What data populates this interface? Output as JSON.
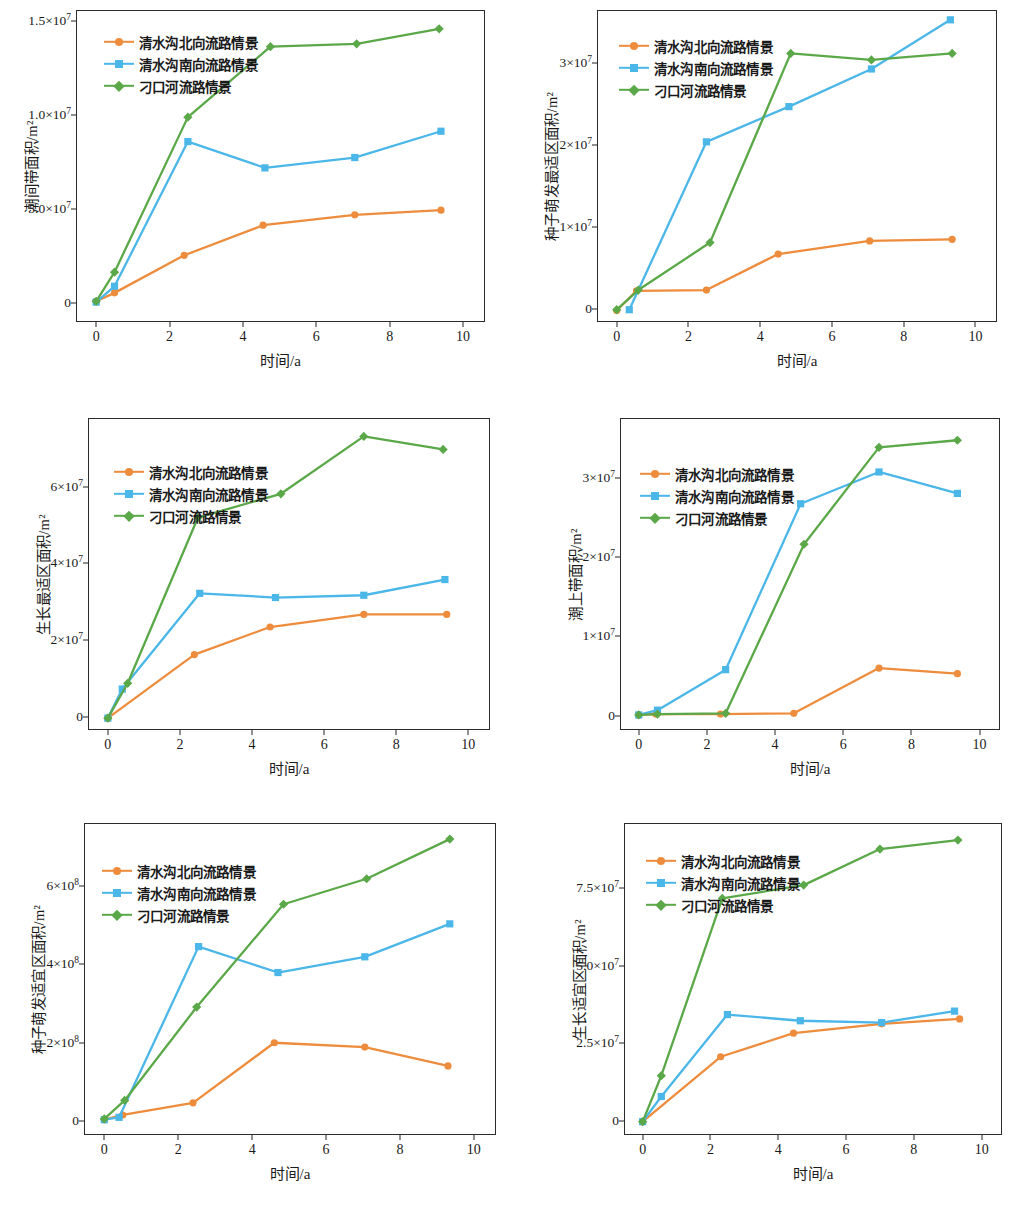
{
  "figure": {
    "panel_count": 6,
    "x_axis_label": "时间/a",
    "x_ticks": [
      "0",
      "2",
      "4",
      "6",
      "8",
      "10"
    ],
    "series_names": [
      "清水沟北向流路情景",
      "清水沟南向流路情景",
      "刁口河流路情景"
    ],
    "colors": {
      "series1": "#ED8C3C",
      "series2": "#4BB6E8",
      "series3": "#5BA849",
      "axis": "#2b2b2b",
      "text": "#1a1a1a"
    },
    "markers": [
      "circle",
      "square",
      "diamond"
    ]
  },
  "chart_data": [
    {
      "type": "line",
      "panel": "top-left",
      "title": "",
      "xlabel": "时间/a",
      "ylabel": "潮间带面积/m²",
      "xlim": [
        -0.55,
        10.6
      ],
      "ylim": [
        -1000000,
        15600000
      ],
      "xticks": [
        0,
        2,
        4,
        6,
        8,
        10
      ],
      "xticklabels": [
        "0",
        "2",
        "4",
        "6",
        "8",
        "10"
      ],
      "yticks": [
        0,
        5000000,
        10000000,
        15000000
      ],
      "yticklabels": [
        "0",
        "5.0×10⁷",
        "1.0×10⁷",
        "1.5×10⁷"
      ],
      "grid": false,
      "legend_position": "upper-left",
      "series": [
        {
          "name": "清水沟北向流路情景",
          "marker": "circle",
          "color": "#ED8C3C",
          "x": [
            0.0,
            0.5,
            2.4,
            4.55,
            7.05,
            9.4
          ],
          "y": [
            100000,
            550000,
            2550000,
            4150000,
            4700000,
            4950000
          ]
        },
        {
          "name": "清水沟南向流路情景",
          "marker": "square",
          "color": "#4BB6E8",
          "x": [
            0.0,
            0.5,
            2.5,
            4.6,
            7.05,
            9.4
          ],
          "y": [
            60000,
            900000,
            8600000,
            7200000,
            7750000,
            9150000
          ]
        },
        {
          "name": "刁口河流路情景",
          "marker": "diamond",
          "color": "#5BA849",
          "x": [
            0.0,
            0.5,
            2.5,
            4.75,
            7.1,
            9.35
          ],
          "y": [
            100000,
            1650000,
            9900000,
            13650000,
            13800000,
            14600000
          ]
        }
      ]
    },
    {
      "type": "line",
      "panel": "top-right",
      "title": "",
      "xlabel": "时间/a",
      "ylabel": "种子萌发最适区面积/m²",
      "xlim": [
        -0.55,
        10.6
      ],
      "ylim": [
        -1600000,
        36500000
      ],
      "xticks": [
        0,
        2,
        4,
        6,
        8,
        10
      ],
      "xticklabels": [
        "0",
        "2",
        "4",
        "6",
        "8",
        "10"
      ],
      "yticks": [
        0,
        10000000,
        20000000,
        30000000
      ],
      "yticklabels": [
        "0",
        "1×10⁷",
        "2×10⁷",
        "3×10⁷"
      ],
      "grid": false,
      "legend_position": "upper-left",
      "series": [
        {
          "name": "清水沟北向流路情景",
          "marker": "circle",
          "color": "#ED8C3C",
          "x": [
            0.0,
            0.55,
            2.5,
            4.5,
            7.05,
            9.35
          ],
          "y": [
            -200000,
            2200000,
            2300000,
            6700000,
            8300000,
            8500000
          ]
        },
        {
          "name": "清水沟南向流路情景",
          "marker": "square",
          "color": "#4BB6E8",
          "x": [
            0.35,
            2.5,
            4.8,
            7.1,
            9.3
          ],
          "y": [
            -100000,
            20400000,
            24700000,
            29300000,
            35300000
          ]
        },
        {
          "name": "刁口河流路情景",
          "marker": "diamond",
          "color": "#5BA849",
          "x": [
            0.0,
            0.6,
            2.6,
            4.85,
            7.1,
            9.35
          ],
          "y": [
            -100000,
            2300000,
            8100000,
            31200000,
            30400000,
            31200000
          ]
        }
      ]
    },
    {
      "type": "line",
      "panel": "middle-left",
      "title": "",
      "xlabel": "时间/a",
      "ylabel": "生长最适区面积/m²",
      "xlim": [
        -0.55,
        10.6
      ],
      "ylim": [
        -3500000,
        78000000
      ],
      "xticks": [
        0,
        2,
        4,
        6,
        8,
        10
      ],
      "xticklabels": [
        "0",
        "2",
        "4",
        "6",
        "8",
        "10"
      ],
      "yticks": [
        0,
        20000000,
        40000000,
        60000000
      ],
      "yticklabels": [
        "0",
        "2×10⁷",
        "4×10⁷",
        "6×10⁷"
      ],
      "grid": false,
      "legend_position": "upper-left",
      "series": [
        {
          "name": "清水沟北向流路情景",
          "marker": "circle",
          "color": "#ED8C3C",
          "x": [
            0.0,
            2.4,
            4.5,
            7.1,
            9.4
          ],
          "y": [
            -400000,
            16200000,
            23400000,
            26700000,
            26700000
          ]
        },
        {
          "name": "清水沟南向流路情景",
          "marker": "square",
          "color": "#4BB6E8",
          "x": [
            0.0,
            0.4,
            2.55,
            4.65,
            7.1,
            9.35
          ],
          "y": [
            -400000,
            7200000,
            32200000,
            31100000,
            31700000,
            35800000
          ]
        },
        {
          "name": "刁口河流路情景",
          "marker": "diamond",
          "color": "#5BA849",
          "x": [
            0.0,
            0.55,
            2.5,
            4.8,
            7.1,
            9.3
          ],
          "y": [
            -400000,
            8700000,
            52000000,
            58200000,
            73200000,
            69800000
          ]
        }
      ]
    },
    {
      "type": "line",
      "panel": "middle-right",
      "title": "",
      "xlabel": "时间/a",
      "ylabel": "潮上带面积/m²",
      "xlim": [
        -0.55,
        10.6
      ],
      "ylim": [
        -1800000,
        37500000
      ],
      "xticks": [
        0,
        2,
        4,
        6,
        8,
        10
      ],
      "xticklabels": [
        "0",
        "2",
        "4",
        "6",
        "8",
        "10"
      ],
      "yticks": [
        0,
        10000000,
        20000000,
        30000000
      ],
      "yticklabels": [
        "0",
        "1×10⁷",
        "2×10⁷",
        "3×10⁷"
      ],
      "grid": false,
      "legend_position": "upper-left",
      "series": [
        {
          "name": "清水沟北向流路情景",
          "marker": "circle",
          "color": "#ED8C3C",
          "x": [
            0.0,
            0.5,
            2.4,
            4.55,
            7.05,
            9.35
          ],
          "y": [
            100000,
            200000,
            200000,
            300000,
            6000000,
            5300000
          ]
        },
        {
          "name": "清水沟南向流路情景",
          "marker": "square",
          "color": "#4BB6E8",
          "x": [
            0.0,
            0.55,
            2.55,
            4.75,
            7.05,
            9.35
          ],
          "y": [
            100000,
            700000,
            5800000,
            26700000,
            30700000,
            28000000
          ]
        },
        {
          "name": "刁口河流路情景",
          "marker": "diamond",
          "color": "#5BA849",
          "x": [
            0.0,
            0.55,
            2.55,
            4.85,
            7.05,
            9.35
          ],
          "y": [
            100000,
            200000,
            300000,
            21600000,
            33800000,
            34700000
          ]
        }
      ]
    },
    {
      "type": "line",
      "panel": "bottom-left",
      "title": "",
      "xlabel": "时间/a",
      "ylabel": "种子萌发适宜区面积/m²",
      "xlim": [
        -0.55,
        10.6
      ],
      "ylim": [
        -35000000,
        760000000
      ],
      "xticks": [
        0,
        2,
        4,
        6,
        8,
        10
      ],
      "xticklabels": [
        "0",
        "2",
        "4",
        "6",
        "8",
        "10"
      ],
      "yticks": [
        0,
        200000000,
        400000000,
        600000000
      ],
      "yticklabels": [
        "0",
        "2×10⁸",
        "4×10⁸",
        "6×10⁸"
      ],
      "grid": false,
      "legend_position": "upper-left",
      "series": [
        {
          "name": "清水沟北向流路情景",
          "marker": "circle",
          "color": "#ED8C3C",
          "x": [
            0.0,
            0.5,
            2.4,
            4.6,
            7.05,
            9.3
          ],
          "y": [
            4000000,
            16000000,
            47000000,
            200000000,
            189000000,
            141000000
          ]
        },
        {
          "name": "清水沟南向流路情景",
          "marker": "square",
          "color": "#4BB6E8",
          "x": [
            0.0,
            0.4,
            2.55,
            4.7,
            7.05,
            9.35
          ],
          "y": [
            4000000,
            10000000,
            445000000,
            379000000,
            419000000,
            503000000
          ]
        },
        {
          "name": "刁口河流路情景",
          "marker": "diamond",
          "color": "#5BA849",
          "x": [
            0.0,
            0.55,
            2.5,
            4.85,
            7.1,
            9.35
          ],
          "y": [
            6000000,
            53000000,
            291000000,
            553000000,
            618000000,
            719000000
          ]
        }
      ]
    },
    {
      "type": "line",
      "panel": "bottom-right",
      "title": "",
      "xlabel": "时间/a",
      "ylabel": "生长适宜区面积/m²",
      "xlim": [
        -0.55,
        10.6
      ],
      "ylim": [
        -4500000,
        96000000
      ],
      "xticks": [
        0,
        2,
        4,
        6,
        8,
        10
      ],
      "xticklabels": [
        "0",
        "2",
        "4",
        "6",
        "8",
        "10"
      ],
      "yticks": [
        0,
        25000000,
        50000000,
        75000000
      ],
      "yticklabels": [
        "0",
        "2.5×10⁷",
        "5.0×10⁷",
        "7.5×10⁷"
      ],
      "grid": false,
      "legend_position": "upper-left",
      "series": [
        {
          "name": "清水沟北向流路情景",
          "marker": "circle",
          "color": "#ED8C3C",
          "x": [
            0.0,
            2.3,
            4.45,
            7.05,
            9.35
          ],
          "y": [
            -200000,
            20700000,
            28300000,
            31300000,
            32900000
          ]
        },
        {
          "name": "清水沟南向流路情景",
          "marker": "square",
          "color": "#4BB6E8",
          "x": [
            0.0,
            0.55,
            2.5,
            4.65,
            7.05,
            9.2
          ],
          "y": [
            -200000,
            7900000,
            34300000,
            32300000,
            31700000,
            35400000
          ]
        },
        {
          "name": "刁口河流路情景",
          "marker": "diamond",
          "color": "#5BA849",
          "x": [
            0.0,
            0.55,
            2.35,
            4.75,
            7.0,
            9.3
          ],
          "y": [
            -200000,
            14600000,
            71700000,
            76000000,
            87600000,
            90500000
          ]
        }
      ]
    }
  ]
}
